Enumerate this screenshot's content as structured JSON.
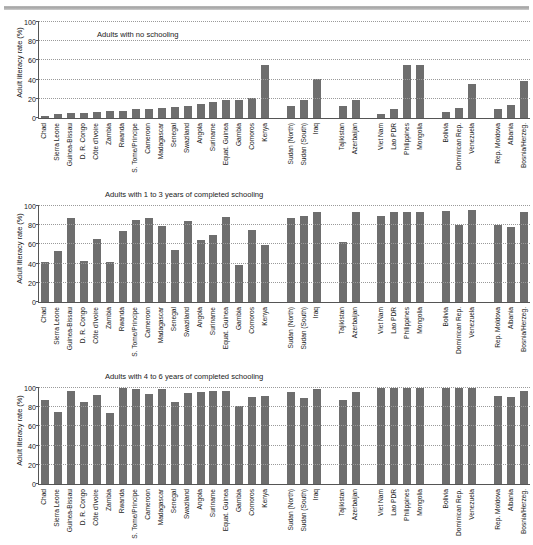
{
  "figure": {
    "ylabel": "Adult literacy rate (%)",
    "bar_color": "#6e6e6e",
    "yticks": [
      0,
      20,
      40,
      60,
      80,
      100
    ],
    "ylim": [
      0,
      100
    ]
  },
  "categories": [
    "Chad",
    "Sierra Leone",
    "Guinea-Bissau",
    "D. R. Congo",
    "Côte d'Ivoire",
    "Zambia",
    "Rwanda",
    "S. Tome/Principe",
    "Cameroon",
    "Madagascar",
    "Senegal",
    "Swaziland",
    "Angola",
    "Suriname",
    "Equat. Guinea",
    "Gambia",
    "Comoros",
    "Kenya",
    "",
    "Sudan (North)",
    "Sudan (South)",
    "Iraq",
    "",
    "Tajikistan",
    "Azerbaijan",
    "",
    "Viet Nam",
    "Lao PDR",
    "Philippines",
    "Mongolia",
    "",
    "Bolivia",
    "Dominican Rep.",
    "Venezuela",
    "",
    "Rep. Moldova",
    "Albania",
    "Bosnia/Herzeg."
  ],
  "chart_data": [
    {
      "type": "bar",
      "title": "",
      "legend": "Adults with no schooling",
      "legend_position": "inside-top-left",
      "ylabel": "Adult literacy rate (%)",
      "xlabel": "",
      "ylim": [
        0,
        100
      ],
      "grid": true,
      "categories": [
        "Chad",
        "Sierra Leone",
        "Guinea-Bissau",
        "D. R. Congo",
        "Côte d'Ivoire",
        "Zambia",
        "Rwanda",
        "S. Tome/Principe",
        "Cameroon",
        "Madagascar",
        "Senegal",
        "Swaziland",
        "Angola",
        "Suriname",
        "Equat. Guinea",
        "Gambia",
        "Comoros",
        "Kenya",
        "",
        "Sudan (North)",
        "Sudan (South)",
        "Iraq",
        "",
        "Tajikistan",
        "Azerbaijan",
        "",
        "Viet Nam",
        "Lao PDR",
        "Philippines",
        "Mongolia",
        "",
        "Bolivia",
        "Dominican Rep.",
        "Venezuela",
        "",
        "Rep. Moldova",
        "Albania",
        "Bosnia/Herzeg."
      ],
      "values": [
        2,
        4,
        5,
        5,
        6,
        7,
        7,
        9,
        9,
        10,
        11,
        13,
        15,
        17,
        19,
        19,
        21,
        55,
        null,
        12,
        19,
        41,
        null,
        13,
        19,
        null,
        4,
        9,
        55,
        55,
        null,
        6,
        10,
        35,
        null,
        9,
        14,
        39
      ]
    },
    {
      "type": "bar",
      "title": "",
      "legend": "Adults with 1 to 3 years of completed schooling",
      "legend_position": "above-plot-left",
      "ylabel": "Adult literacy rate (%)",
      "xlabel": "",
      "ylim": [
        0,
        100
      ],
      "grid": true,
      "categories": [
        "Chad",
        "Sierra Leone",
        "Guinea-Bissau",
        "D. R. Congo",
        "Côte d'Ivoire",
        "Zambia",
        "Rwanda",
        "S. Tome/Principe",
        "Cameroon",
        "Madagascar",
        "Senegal",
        "Swaziland",
        "Angola",
        "Suriname",
        "Equat. Guinea",
        "Gambia",
        "Comoros",
        "Kenya",
        "",
        "Sudan (North)",
        "Sudan (South)",
        "Iraq",
        "",
        "Tajikistan",
        "Azerbaijan",
        "",
        "Viet Nam",
        "Lao PDR",
        "Philippines",
        "Mongolia",
        "",
        "Bolivia",
        "Dominican Rep.",
        "Venezuela",
        "",
        "Rep. Moldova",
        "Albania",
        "Bosnia/Herzeg."
      ],
      "values": [
        42,
        53,
        87,
        43,
        66,
        42,
        74,
        85,
        88,
        79,
        54,
        84,
        65,
        70,
        89,
        39,
        75,
        59,
        null,
        87,
        90,
        94,
        null,
        63,
        94,
        null,
        90,
        94,
        94,
        94,
        null,
        95,
        80,
        96,
        null,
        80,
        78,
        94
      ]
    },
    {
      "type": "bar",
      "title": "",
      "legend": "Adults with 4 to 6 years of completed schooling",
      "legend_position": "above-plot-left",
      "ylabel": "Adult literacy rate (%)",
      "xlabel": "",
      "ylim": [
        0,
        100
      ],
      "grid": true,
      "categories": [
        "Chad",
        "Sierra Leone",
        "Guinea-Bissau",
        "D. R. Congo",
        "Côte d'Ivoire",
        "Zambia",
        "Rwanda",
        "S. Tome/Principe",
        "Cameroon",
        "Madagascar",
        "Senegal",
        "Swaziland",
        "Angola",
        "Suriname",
        "Equat. Guinea",
        "Gambia",
        "Comoros",
        "Kenya",
        "",
        "Sudan (North)",
        "Sudan (South)",
        "Iraq",
        "",
        "Tajikistan",
        "Azerbaijan",
        "",
        "Viet Nam",
        "Lao PDR",
        "Philippines",
        "Mongolia",
        "",
        "Bolivia",
        "Dominican Rep.",
        "Venezuela",
        "",
        "Rep. Moldova",
        "Albania",
        "Bosnia/Herzeg."
      ],
      "values": [
        88,
        75,
        97,
        85,
        93,
        74,
        100,
        99,
        94,
        99,
        85,
        95,
        96,
        97,
        97,
        81,
        91,
        92,
        null,
        96,
        90,
        99,
        null,
        87,
        96,
        null,
        100,
        100,
        100,
        100,
        null,
        100,
        100,
        100,
        null,
        92,
        91,
        97
      ]
    }
  ]
}
